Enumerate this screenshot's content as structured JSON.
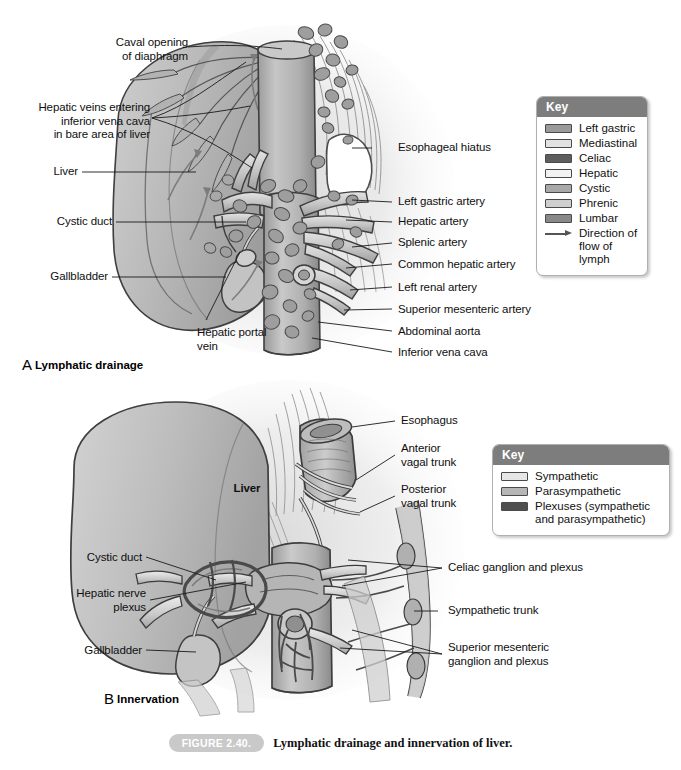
{
  "figure": {
    "number": "FIGURE 2.40.",
    "caption": "Lymphatic drainage and innervation of liver."
  },
  "panel_a": {
    "letter": "A",
    "name": "Lymphatic drainage",
    "labels": {
      "caval_opening": "Caval opening\nof diaphragm",
      "hepatic_veins": "Hepatic veins entering\ninferior vena cava\nin bare area of liver",
      "liver": "Liver",
      "cystic_duct": "Cystic duct",
      "gallbladder": "Gallbladder",
      "hepatic_portal_vein": "Hepatic portal\nvein",
      "esophageal_hiatus": "Esophageal hiatus",
      "left_gastric_artery": "Left gastric artery",
      "hepatic_artery": "Hepatic artery",
      "splenic_artery": "Splenic artery",
      "common_hepatic_artery": "Common hepatic artery",
      "left_renal_artery": "Left renal artery",
      "superior_mesenteric_artery": "Superior mesenteric artery",
      "abdominal_aorta": "Abdominal aorta",
      "inferior_vena_cava": "Inferior vena cava"
    },
    "key": {
      "title": "Key",
      "items": [
        {
          "label": "Left gastric",
          "color": "#9a9a9a",
          "type": "swatch"
        },
        {
          "label": "Mediastinal",
          "color": "#e2e2e2",
          "type": "swatch"
        },
        {
          "label": "Celiac",
          "color": "#5e5e5e",
          "type": "swatch"
        },
        {
          "label": "Hepatic",
          "color": "#f2f2f2",
          "type": "swatch"
        },
        {
          "label": "Cystic",
          "color": "#a8a8a8",
          "type": "swatch"
        },
        {
          "label": "Phrenic",
          "color": "#cfcfcf",
          "type": "swatch"
        },
        {
          "label": "Lumbar",
          "color": "#888888",
          "type": "swatch"
        },
        {
          "label": "Direction of\nflow of lymph",
          "color": "#555555",
          "type": "arrow"
        }
      ]
    }
  },
  "panel_b": {
    "letter": "B",
    "name": "Innervation",
    "labels": {
      "liver": "Liver",
      "esophagus": "Esophagus",
      "anterior_vagal_trunk": "Anterior\nvagal trunk",
      "posterior_vagal_trunk": "Posterior\nvagal trunk",
      "cystic_duct": "Cystic duct",
      "hepatic_nerve_plexus": "Hepatic nerve\nplexus",
      "gallbladder": "Gallbladder",
      "celiac_ganglion": "Celiac ganglion and plexus",
      "sympathetic_trunk": "Sympathetic trunk",
      "superior_mesenteric_ganglion": "Superior mesenteric\nganglion and plexus"
    },
    "key": {
      "title": "Key",
      "items": [
        {
          "label": "Sympathetic",
          "color": "#e6e6e6",
          "type": "swatch"
        },
        {
          "label": "Parasympathetic",
          "color": "#b6b6b6",
          "type": "swatch"
        },
        {
          "label": "Plexuses (sympathetic\nand parasympathetic)",
          "color": "#4f4f4f",
          "type": "swatch"
        }
      ]
    }
  },
  "palette": {
    "key_header": "#7d7d7d",
    "caption_pill": "#c9c9c9",
    "outline": "#3a3a3a",
    "tissue_light": "#d8d8d8",
    "tissue_mid": "#b4b4b4",
    "tissue_dark": "#8e8e8e",
    "node": "#9b9b9b",
    "vessel": "#c4c4c4"
  }
}
